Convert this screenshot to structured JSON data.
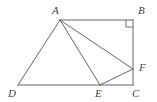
{
  "figure": {
    "kind": "geometry-diagram",
    "width": 157,
    "height": 102,
    "background_color": "#ffffff",
    "stroke_color": "#666666",
    "label_color": "#444444"
  },
  "labels": {
    "A": "A",
    "B": "B",
    "C": "C",
    "D": "D",
    "E": "E",
    "F": "F"
  },
  "chart_data": {
    "type": "diagram",
    "title": "",
    "points": [
      {
        "name": "A",
        "x": 60,
        "y": 20,
        "label_x": 52,
        "label_y": 5,
        "label_anchor": "above-left"
      },
      {
        "name": "B",
        "x": 133,
        "y": 20,
        "label_x": 138,
        "label_y": 5,
        "label_anchor": "above-right"
      },
      {
        "name": "C",
        "x": 133,
        "y": 85,
        "label_x": 132,
        "label_y": 88,
        "label_anchor": "below"
      },
      {
        "name": "D",
        "x": 18,
        "y": 85,
        "label_x": 8,
        "label_y": 88,
        "label_anchor": "below-left"
      },
      {
        "name": "E",
        "x": 100,
        "y": 85,
        "label_x": 95,
        "label_y": 88,
        "label_anchor": "below"
      },
      {
        "name": "F",
        "x": 133,
        "y": 69,
        "label_x": 139,
        "label_y": 62,
        "label_anchor": "right"
      }
    ],
    "segments": [
      {
        "from": "A",
        "to": "B"
      },
      {
        "from": "B",
        "to": "C"
      },
      {
        "from": "D",
        "to": "C"
      },
      {
        "from": "A",
        "to": "D"
      },
      {
        "from": "A",
        "to": "E"
      },
      {
        "from": "A",
        "to": "F"
      },
      {
        "from": "E",
        "to": "F"
      }
    ],
    "right_angles": [
      {
        "at": "B",
        "size": 7
      }
    ]
  }
}
